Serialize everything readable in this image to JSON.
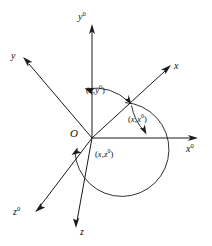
{
  "figure": {
    "background_color": "#ffffff",
    "line_color": "#1a1a1a",
    "width": 212,
    "height": 246
  },
  "origin": {
    "label": "O",
    "x": 92,
    "y": 138
  },
  "axes": [
    {
      "name": "y0-axis",
      "label_base": "y",
      "label_sup": "0",
      "from": [
        92,
        138
      ],
      "to": [
        92,
        26
      ],
      "label_x": 78,
      "label_y": 12
    },
    {
      "name": "x0-axis",
      "label_base": "x",
      "label_sup": "0",
      "from": [
        92,
        138
      ],
      "to": [
        198,
        138
      ],
      "label_x": 187,
      "label_y": 142
    },
    {
      "name": "z0-axis",
      "label_base": "z",
      "label_sup": "0",
      "from": [
        92,
        138
      ],
      "to": [
        36,
        211
      ],
      "label_x": 13,
      "label_y": 209
    },
    {
      "name": "y-axis",
      "label_base": "y",
      "label_sup": "",
      "from": [
        92,
        138
      ],
      "to": [
        24,
        59
      ],
      "label_x": 12,
      "label_y": 52
    },
    {
      "name": "x-axis",
      "label_base": "x",
      "label_sup": "",
      "from": [
        92,
        138
      ],
      "to": [
        170,
        66
      ],
      "label_x": 174,
      "label_y": 64
    },
    {
      "name": "z-axis",
      "label_base": "z",
      "label_sup": "",
      "from": [
        92,
        138
      ],
      "to": [
        76,
        228
      ],
      "label_x": 79,
      "label_y": 228
    }
  ],
  "angles": [
    {
      "name": "angle-x-y0",
      "open": "(",
      "first": "x",
      "sep": ",",
      "second": "y",
      "second_sup": "0",
      "close": ")",
      "label_x": 86,
      "label_y": 88
    },
    {
      "name": "angle-x-x0",
      "open": "(",
      "first": "x",
      "sep": ",",
      "second": "x",
      "second_sup": "0",
      "close": ")",
      "label_x": 128,
      "label_y": 117
    },
    {
      "name": "angle-x-z0",
      "open": "(",
      "first": "x",
      "sep": ",",
      "second": "z",
      "second_sup": "0",
      "close": ")",
      "label_x": 95,
      "label_y": 152
    }
  ]
}
